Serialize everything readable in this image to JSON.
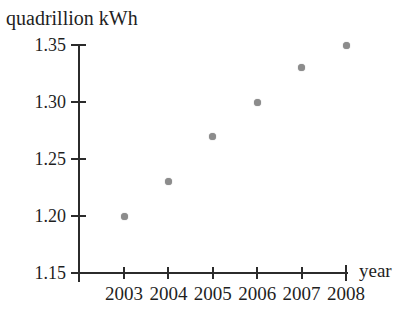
{
  "chart_data": {
    "type": "scatter",
    "title": "quadrillion kWh",
    "xlabel": "year",
    "ylabel": "quadrillion kWh",
    "x": [
      2003,
      2004,
      2005,
      2006,
      2007,
      2008
    ],
    "values": [
      1.2,
      1.23,
      1.27,
      1.3,
      1.33,
      1.35
    ],
    "series_name": "electricity use",
    "xticks": [
      2003,
      2004,
      2005,
      2006,
      2007,
      2008
    ],
    "yticks": [
      1.15,
      1.2,
      1.25,
      1.3,
      1.35
    ],
    "ylim": [
      1.15,
      1.35
    ],
    "xlim": [
      2003,
      2008
    ],
    "grid": false,
    "legend": false,
    "point_color": "#8c8c8c",
    "axis_color": "#2b2b2b",
    "text_color": "#1f1f1f",
    "background": "#ffffff"
  }
}
